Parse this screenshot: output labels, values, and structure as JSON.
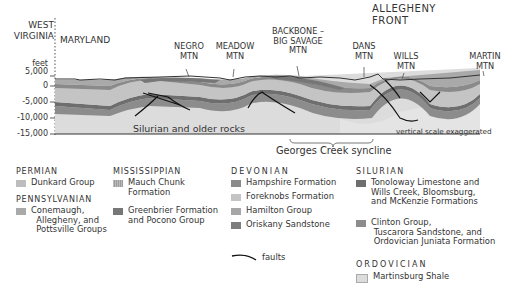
{
  "title_labels": {
    "west_virginia": "WEST\nVIRGINIA",
    "maryland": "MARYLAND",
    "allegheny_front": "ALLEGHENY\nFRONT"
  },
  "mountains": [
    {
      "name": "NEGRO\nMTN"
    },
    {
      "name": "MEADOW\nMTN"
    },
    {
      "name": "BACKBONE –\nBIG SAVAGE\nMTN"
    },
    {
      "name": "DANS\nMTN"
    },
    {
      "name": "WILLS\nMTN"
    },
    {
      "name": "MARTIN\nMTN"
    }
  ],
  "axis": {
    "unit": "feet",
    "ticks": [
      "5,000",
      "0",
      "-5,000",
      "-10,000",
      "-15,000"
    ]
  },
  "section_labels": {
    "older_rocks": "Silurian and older rocks",
    "scale_note": "vertical scale exaggerated",
    "syncline": "Georges Creek syncline"
  },
  "legend": {
    "permian": {
      "title": "PERMIAN",
      "items": [
        {
          "label": "Dunkard Group",
          "color": "#bdbdbd"
        }
      ]
    },
    "pennsylvanian": {
      "title": "PENNSYLVANIAN",
      "items": [
        {
          "label": "Conemaugh,\n  Allegheny, and\n  Pottsville Groups",
          "color": "#a9a9a9"
        }
      ]
    },
    "mississippian": {
      "title": "MISSISSIPPIAN",
      "items": [
        {
          "label": "Mauch Chunk\nFormation",
          "color": "#9a9a9a"
        },
        {
          "label": "Greenbrier Formation\nand Pocono Group",
          "color": "#777777"
        }
      ]
    },
    "devonian": {
      "title": "DEVONIAN",
      "items": [
        {
          "label": "Hampshire Formation",
          "color": "#8a8a8a"
        },
        {
          "label": "Foreknobs Formation",
          "color": "#c4c4c4"
        },
        {
          "label": "Hamilton Group",
          "color": "#a6a6a6"
        },
        {
          "label": "Oriskany Sandstone",
          "color": "#7e7e7e"
        }
      ]
    },
    "faults": {
      "label": "faults"
    },
    "silurian": {
      "title": "SILURIAN",
      "items": [
        {
          "label": "Tonoloway Limestone and\nWills Creek, Bloomsburg,\nand McKenzie Formations",
          "color": "#6e6e6e"
        },
        {
          "label": "Clinton Group,\n Tuscarora Sandstone, and\n Ordovician Juniata Formation",
          "color": "#8c8c8c"
        }
      ]
    },
    "ordovician": {
      "title": "ORDOVICIAN",
      "items": [
        {
          "label": "Martinsburg Shale",
          "color": "#dcdcdc"
        }
      ]
    }
  }
}
